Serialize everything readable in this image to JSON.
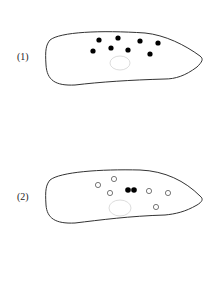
{
  "figures": [
    {
      "label": "(1)",
      "description": "Cell outline with eight filled dots and a faint oval nucleus",
      "filled_dots": 8,
      "open_dots": 0
    },
    {
      "label": "(2)",
      "description": "Cell outline with six open circles, a filled paired dot, and a faint oval nucleus",
      "filled_dots": 2,
      "open_dots": 6
    }
  ],
  "colors": {
    "outline": "#333333",
    "dot": "#000000",
    "nucleus": "#dddddd"
  }
}
